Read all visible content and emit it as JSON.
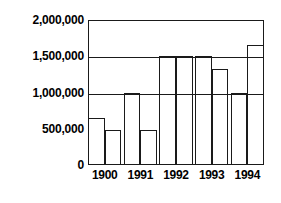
{
  "chart_data": {
    "type": "bar",
    "title": "",
    "subtitle": "",
    "xlabel": "",
    "ylabel": "",
    "categories": [
      "1900",
      "1991",
      "1992",
      "1993",
      "1994"
    ],
    "series": [
      {
        "name": "series-1",
        "values": [
          650000,
          1000000,
          1500000,
          1500000,
          1000000
        ]
      },
      {
        "name": "series-2",
        "values": [
          480000,
          480000,
          1500000,
          1320000,
          1650000
        ]
      }
    ],
    "ylim": [
      0,
      2000000
    ],
    "ytick_values": [
      2000000,
      1500000,
      1000000,
      500000,
      0
    ],
    "ytick_labels": [
      "2,000,000",
      "1,500,000",
      "1,000,000",
      "500,000",
      "0"
    ],
    "xtick_labels": [
      "1900",
      "1991",
      "1992",
      "1993",
      "1994"
    ],
    "grid": true,
    "grid_axis": "y",
    "legend": false,
    "legend_position": "none",
    "bar_fill_color": "#ffffff",
    "bar_edge_color": "#1a1a1a",
    "axis_color": "#1a1a1a",
    "background_color": "#ffffff",
    "text_color": "#000000",
    "annotations": []
  }
}
